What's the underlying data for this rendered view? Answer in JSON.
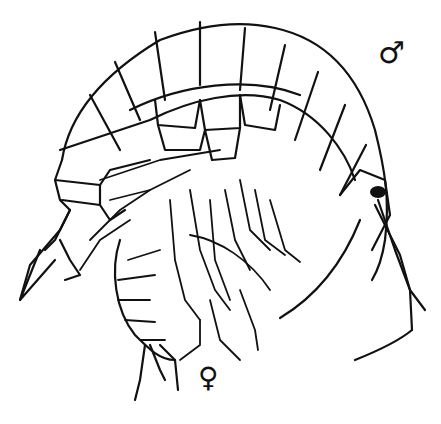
{
  "figure": {
    "labels": {
      "male_symbol": "♂",
      "female_symbol": "♀"
    },
    "caption": "",
    "colors": {
      "ink": "#111111",
      "background": "#ffffff"
    }
  }
}
